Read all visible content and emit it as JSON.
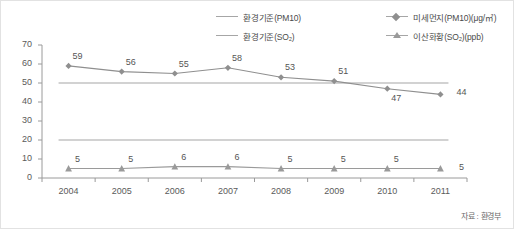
{
  "legend": {
    "items": [
      {
        "label": "환경기준(PM10)",
        "marker": "line",
        "color": "#a6a6a6",
        "col": 1,
        "row": 1
      },
      {
        "label": "환경기준(SO₂)",
        "marker": "line",
        "color": "#a6a6a6",
        "col": 1,
        "row": 2
      },
      {
        "label": "미세먼지(PM10)(μg/㎥)",
        "marker": "diamond-line",
        "color": "#8f8f8f",
        "col": 2,
        "row": 1
      },
      {
        "label": "이산화황(SO₂)(ppb)",
        "marker": "triangle-line",
        "color": "#9a9a9a",
        "col": 2,
        "row": 2
      }
    ]
  },
  "source_note": "자료 : 환경부",
  "chart_data": {
    "type": "line",
    "title": "",
    "subtitle": "",
    "xlabel": "",
    "ylabel": "",
    "categories": [
      "2004",
      "2005",
      "2006",
      "2007",
      "2008",
      "2009",
      "2010",
      "2011"
    ],
    "ylim": [
      0,
      70
    ],
    "yticks": [
      0,
      10,
      20,
      30,
      40,
      50,
      60,
      70
    ],
    "grid": false,
    "legend_position": "top-right",
    "series": [
      {
        "name": "미세먼지(PM10)(μg/㎥)",
        "marker": "diamond",
        "color": "#8f8f8f",
        "values": [
          59,
          56,
          55,
          58,
          53,
          51,
          47,
          44
        ],
        "labels": [
          "59",
          "56",
          "55",
          "58",
          "53",
          "51",
          "47",
          "44"
        ],
        "label_positions": [
          "above",
          "above",
          "above",
          "above",
          "above",
          "above",
          "below",
          "right"
        ]
      },
      {
        "name": "이산화황(SO₂)(ppb)",
        "marker": "triangle",
        "color": "#9a9a9a",
        "values": [
          5,
          5,
          6,
          6,
          5,
          5,
          5,
          5
        ],
        "labels": [
          "5",
          "5",
          "6",
          "6",
          "5",
          "5",
          "5",
          "5"
        ],
        "label_positions": [
          "above",
          "above",
          "above",
          "above",
          "above",
          "above",
          "above",
          "right"
        ]
      }
    ],
    "reference_lines": [
      {
        "name": "환경기준(PM10)",
        "value": 50,
        "color": "#a6a6a6"
      },
      {
        "name": "환경기준(SO₂)",
        "value": 20,
        "color": "#a6a6a6"
      }
    ]
  }
}
